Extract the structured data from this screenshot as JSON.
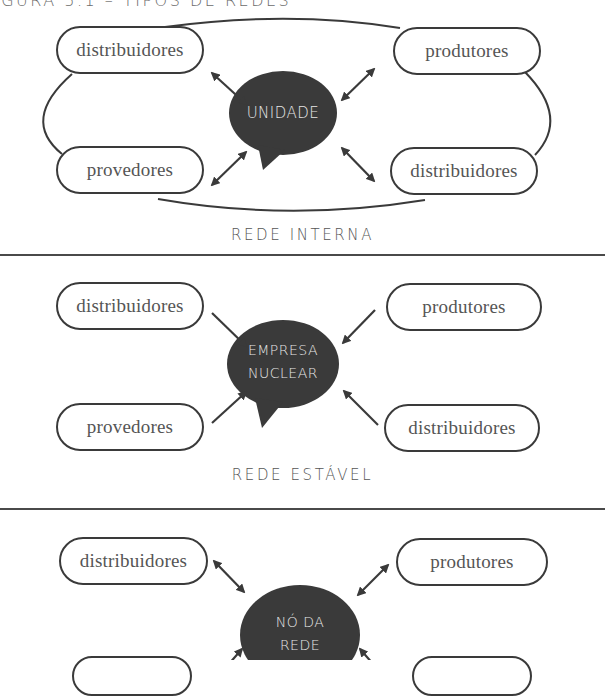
{
  "figure": {
    "title": "IGURA 5.1 – TIPOS DE REDES"
  },
  "colors": {
    "bubble_fill": "#3a3a3a",
    "stroke": "#3a3a3a",
    "label_text": "#555555",
    "bubble_text": "#e6e6e6"
  },
  "diagrams": [
    {
      "label": "REDE INTERNA",
      "center": "UNIDADE",
      "center_lines": [
        "UNIDADE"
      ],
      "arrow_style": "bidirectional",
      "outer_loop": true,
      "nodes": {
        "top_left": "distribuidores",
        "top_right": "produtores",
        "bottom_left": "provedores",
        "bottom_right": "distribuidores"
      }
    },
    {
      "label": "REDE ESTÁVEL",
      "center_lines": [
        "EMPRESA",
        "NUCLEAR"
      ],
      "arrow_style": "inward",
      "outer_loop": false,
      "nodes": {
        "top_left": "distribuidores",
        "top_right": "produtores",
        "bottom_left": "provedores",
        "bottom_right": "distribuidores"
      }
    },
    {
      "label": "",
      "center_lines": [
        "NÓ DA",
        "REDE"
      ],
      "arrow_style": "bidirectional",
      "outer_loop": false,
      "nodes": {
        "top_left": "distribuidores",
        "top_right": "produtores"
      }
    }
  ]
}
